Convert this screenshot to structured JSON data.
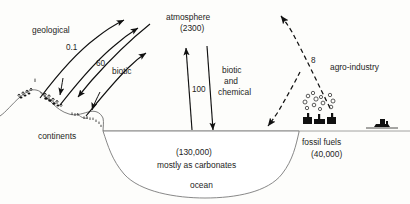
{
  "diagram": {
    "type": "flow-diagram",
    "reservoirs": [
      {
        "id": "atmosphere",
        "label": "atmosphere",
        "value": "(2300)"
      },
      {
        "id": "ocean",
        "label": "ocean",
        "value": "(130,000)",
        "note": "mostly as carbonates"
      },
      {
        "id": "continents",
        "label": "continents",
        "value": ""
      },
      {
        "id": "fossilfuels",
        "label": "fossil fuels",
        "value": "(40,000)"
      }
    ],
    "labels": {
      "atmosphere": "atmosphere",
      "atmosphere_value": "(2300)",
      "ocean": "ocean",
      "ocean_value": "(130,000)",
      "ocean_note": "mostly as carbonates",
      "continents": "continents",
      "fossil_fuels": "fossil fuels",
      "fossil_fuels_value": "(40,000)",
      "agro_industry": "agro-industry",
      "geological": "geological",
      "biotic": "biotic",
      "biotic_and_chemical_l1": "biotic",
      "biotic_and_chemical_l2": "and",
      "biotic_and_chemical_l3": "chemical"
    },
    "fluxes": [
      {
        "id": "geological",
        "label": "geological",
        "value": "0.1",
        "from": "continents",
        "to": "atmosphere",
        "style": "solid"
      },
      {
        "id": "biotic",
        "label": "biotic",
        "value": "60",
        "from": "continents",
        "to": "atmosphere",
        "style": "solid"
      },
      {
        "id": "ocean-exchange",
        "label": "biotic and chemical",
        "value": "100",
        "from": "ocean",
        "to": "atmosphere",
        "style": "solid"
      },
      {
        "id": "agro-industry",
        "label": "agro-industry",
        "value": "8",
        "from": "fossil fuels",
        "to": "atmosphere",
        "style": "dashed"
      }
    ],
    "flux_values": {
      "geological": "0.1",
      "biotic": "60",
      "ocean_exchange": "100",
      "agro_industry": "8"
    },
    "colors": {
      "ink": "#111111",
      "terrain": "#6e6e6e",
      "sea": "#8a8a8a",
      "background": "#fdfdfb"
    }
  }
}
